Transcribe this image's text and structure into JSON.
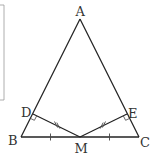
{
  "diagram": {
    "type": "geometry",
    "colors": {
      "stroke": "#222222",
      "label": "#333333",
      "frame": "#999999"
    },
    "points": {
      "A": {
        "label": "A",
        "x": 80,
        "y": 19
      },
      "B": {
        "label": "B",
        "x": 21,
        "y": 137
      },
      "C": {
        "label": "C",
        "x": 139,
        "y": 137
      },
      "M": {
        "label": "M",
        "x": 80,
        "y": 137
      },
      "D": {
        "label": "D",
        "x": 33,
        "y": 114
      },
      "E": {
        "label": "E",
        "x": 127,
        "y": 114
      }
    },
    "segments": [
      "AB",
      "AC",
      "BC",
      "MD",
      "ME"
    ],
    "marks": {
      "single_tick": [
        "BM",
        "MC"
      ],
      "double_tick": [
        "DM",
        "EM"
      ],
      "right_angle": [
        "D",
        "E"
      ]
    }
  }
}
